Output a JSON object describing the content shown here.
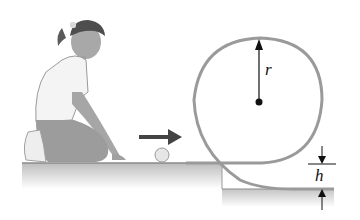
{
  "diagram": {
    "labels": {
      "radius": "r",
      "height": "h"
    },
    "elements": {
      "person": "girl-kneeling",
      "ball": "ball",
      "motion_arrow": "right",
      "loop_track": "circular-loop",
      "loop_center": "center-dot"
    },
    "colors": {
      "track": "#9a9a9a",
      "ground": "#c8c8c8",
      "arrow": "#444444",
      "text": "#111111"
    }
  }
}
